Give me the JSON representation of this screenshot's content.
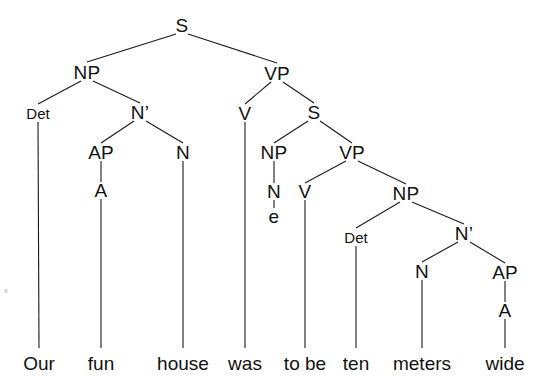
{
  "diagram": {
    "type": "syntax-tree",
    "sentence": "Our fun house was to be ten meters wide",
    "background_color": "#ffffff",
    "line_color": "#1a1a1a",
    "text_color": "#111111"
  },
  "nodes": [
    {
      "id": "S1",
      "label": "S",
      "x": 182,
      "y": 25,
      "size": "cat"
    },
    {
      "id": "NP1",
      "label": "NP",
      "x": 87,
      "y": 72,
      "size": "cat"
    },
    {
      "id": "VP1",
      "label": "VP",
      "x": 277,
      "y": 73,
      "size": "cat"
    },
    {
      "id": "Det1",
      "label": "Det",
      "x": 38,
      "y": 113,
      "size": "cat-sm"
    },
    {
      "id": "Nbar1",
      "label": "N’",
      "x": 140,
      "y": 112,
      "size": "cat"
    },
    {
      "id": "V1",
      "label": "V",
      "x": 245,
      "y": 113,
      "size": "cat"
    },
    {
      "id": "S2",
      "label": "S",
      "x": 314,
      "y": 112,
      "size": "cat"
    },
    {
      "id": "AP1",
      "label": "AP",
      "x": 101,
      "y": 152,
      "size": "cat"
    },
    {
      "id": "N1",
      "label": "N",
      "x": 183,
      "y": 152,
      "size": "cat"
    },
    {
      "id": "NP2",
      "label": "NP",
      "x": 274,
      "y": 152,
      "size": "cat"
    },
    {
      "id": "VP2",
      "label": "VP",
      "x": 352,
      "y": 152,
      "size": "cat"
    },
    {
      "id": "A1",
      "label": "A",
      "x": 101,
      "y": 190,
      "size": "cat"
    },
    {
      "id": "N2",
      "label": "N",
      "x": 274,
      "y": 191,
      "size": "cat"
    },
    {
      "id": "V2",
      "label": "V",
      "x": 305,
      "y": 191,
      "size": "cat"
    },
    {
      "id": "NP3",
      "label": "NP",
      "x": 406,
      "y": 193,
      "size": "cat"
    },
    {
      "id": "e1",
      "label": "e",
      "x": 274,
      "y": 216,
      "size": "cat"
    },
    {
      "id": "Det2",
      "label": "Det",
      "x": 356,
      "y": 237,
      "size": "cat-sm"
    },
    {
      "id": "Nbar2",
      "label": "N’",
      "x": 464,
      "y": 233,
      "size": "cat"
    },
    {
      "id": "N3",
      "label": "N",
      "x": 422,
      "y": 271,
      "size": "cat"
    },
    {
      "id": "AP2",
      "label": "AP",
      "x": 505,
      "y": 272,
      "size": "cat"
    },
    {
      "id": "A2",
      "label": "A",
      "x": 505,
      "y": 310,
      "size": "cat"
    }
  ],
  "leaves": [
    {
      "id": "w1",
      "label": "Our",
      "x": 39,
      "y": 363
    },
    {
      "id": "w2",
      "label": "fun",
      "x": 101,
      "y": 363
    },
    {
      "id": "w3",
      "label": "house",
      "x": 183,
      "y": 363
    },
    {
      "id": "w4",
      "label": "was",
      "x": 245,
      "y": 363
    },
    {
      "id": "w5",
      "label": "to be",
      "x": 305,
      "y": 363
    },
    {
      "id": "w6",
      "label": "ten",
      "x": 356,
      "y": 363
    },
    {
      "id": "w7",
      "label": "meters",
      "x": 422,
      "y": 363
    },
    {
      "id": "w8",
      "label": "wide",
      "x": 505,
      "y": 363
    }
  ],
  "edges": [
    {
      "from": "S1",
      "to": "NP1",
      "x1": 176,
      "y1": 34,
      "x2": 87,
      "y2": 62
    },
    {
      "from": "S1",
      "to": "VP1",
      "x1": 188,
      "y1": 34,
      "x2": 277,
      "y2": 63
    },
    {
      "from": "NP1",
      "to": "Det1",
      "x1": 81,
      "y1": 81,
      "x2": 38,
      "y2": 104
    },
    {
      "from": "NP1",
      "to": "Nbar1",
      "x1": 93,
      "y1": 81,
      "x2": 140,
      "y2": 103
    },
    {
      "from": "VP1",
      "to": "V1",
      "x1": 271,
      "y1": 82,
      "x2": 245,
      "y2": 104
    },
    {
      "from": "VP1",
      "to": "S2",
      "x1": 283,
      "y1": 82,
      "x2": 314,
      "y2": 103
    },
    {
      "from": "Det1",
      "to": "w1",
      "x1": 38,
      "y1": 122,
      "x2": 39,
      "y2": 348
    },
    {
      "from": "Nbar1",
      "to": "AP1",
      "x1": 134,
      "y1": 121,
      "x2": 101,
      "y2": 143
    },
    {
      "from": "Nbar1",
      "to": "N1",
      "x1": 146,
      "y1": 121,
      "x2": 183,
      "y2": 143
    },
    {
      "from": "V1",
      "to": "w4",
      "x1": 245,
      "y1": 122,
      "x2": 245,
      "y2": 348
    },
    {
      "from": "S2",
      "to": "NP2",
      "x1": 308,
      "y1": 121,
      "x2": 274,
      "y2": 143
    },
    {
      "from": "S2",
      "to": "VP2",
      "x1": 320,
      "y1": 121,
      "x2": 352,
      "y2": 143
    },
    {
      "from": "AP1",
      "to": "A1",
      "x1": 101,
      "y1": 161,
      "x2": 101,
      "y2": 182
    },
    {
      "from": "N1",
      "to": "w3",
      "x1": 183,
      "y1": 161,
      "x2": 183,
      "y2": 348
    },
    {
      "from": "NP2",
      "to": "N2",
      "x1": 274,
      "y1": 161,
      "x2": 274,
      "y2": 183
    },
    {
      "from": "VP2",
      "to": "V2",
      "x1": 346,
      "y1": 161,
      "x2": 305,
      "y2": 183
    },
    {
      "from": "VP2",
      "to": "NP3",
      "x1": 358,
      "y1": 161,
      "x2": 406,
      "y2": 184
    },
    {
      "from": "A1",
      "to": "w2",
      "x1": 101,
      "y1": 199,
      "x2": 101,
      "y2": 348
    },
    {
      "from": "N2",
      "to": "e1",
      "x1": 274,
      "y1": 200,
      "x2": 274,
      "y2": 208
    },
    {
      "from": "V2",
      "to": "w5",
      "x1": 305,
      "y1": 200,
      "x2": 305,
      "y2": 348
    },
    {
      "from": "NP3",
      "to": "Det2",
      "x1": 400,
      "y1": 202,
      "x2": 356,
      "y2": 228
    },
    {
      "from": "NP3",
      "to": "Nbar2",
      "x1": 412,
      "y1": 202,
      "x2": 464,
      "y2": 224
    },
    {
      "from": "Det2",
      "to": "w6",
      "x1": 356,
      "y1": 246,
      "x2": 356,
      "y2": 348
    },
    {
      "from": "Nbar2",
      "to": "N3",
      "x1": 458,
      "y1": 242,
      "x2": 422,
      "y2": 262
    },
    {
      "from": "Nbar2",
      "to": "AP2",
      "x1": 470,
      "y1": 242,
      "x2": 505,
      "y2": 263
    },
    {
      "from": "N3",
      "to": "w7",
      "x1": 422,
      "y1": 280,
      "x2": 422,
      "y2": 348
    },
    {
      "from": "AP2",
      "to": "A2",
      "x1": 505,
      "y1": 281,
      "x2": 505,
      "y2": 302
    },
    {
      "from": "A2",
      "to": "w8",
      "x1": 505,
      "y1": 319,
      "x2": 505,
      "y2": 348
    }
  ],
  "artifacts": [
    {
      "id": "speck",
      "x": 6,
      "y": 291
    }
  ]
}
